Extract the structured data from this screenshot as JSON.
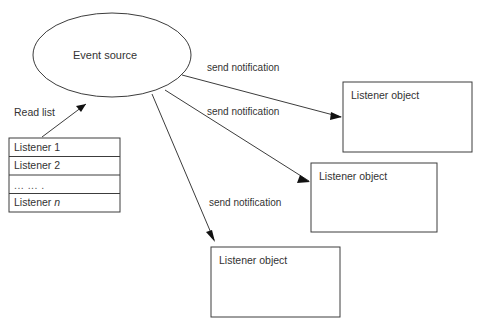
{
  "diagram": {
    "title_text": "Event source",
    "read_list_label": "Read list",
    "colors": {
      "background": "#ffffff",
      "stroke": "#3c3c3c",
      "text": "#333333",
      "arrowhead": "#111111"
    },
    "source_node": {
      "label": "Event source",
      "shape": "ellipse"
    },
    "listener_list": {
      "rows": [
        {
          "label": "Listener 1"
        },
        {
          "label": "Listener 2"
        },
        {
          "label": "... ... ."
        },
        {
          "label": "Listener n",
          "italic_suffix": "n"
        }
      ]
    },
    "listener_objects": [
      {
        "label": "Listener object"
      },
      {
        "label": "Listener object"
      },
      {
        "label": "Listener object"
      }
    ],
    "edges": [
      {
        "label": "send notification"
      },
      {
        "label": "send notification"
      },
      {
        "label": "send notification"
      }
    ]
  }
}
